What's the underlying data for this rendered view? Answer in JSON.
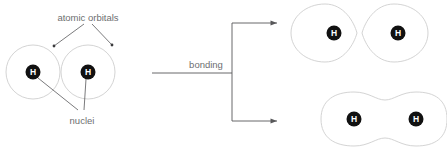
{
  "diagram": {
    "colors": {
      "background": "#ffffff",
      "orbital_stroke": "#d4d4d4",
      "nucleus_fill": "#111111",
      "nucleus_text": "#ffffff",
      "annotation_text": "#6d6e70",
      "leader_line": "#58585a"
    },
    "labels": {
      "atomic_orbitals": "atomic orbitals",
      "nuclei": "nuclei",
      "bonding": "bonding"
    },
    "left_group": {
      "name": "two separate hydrogen atomic orbitals",
      "atoms": [
        {
          "symbol": "H",
          "cx": 33,
          "cy": 72
        },
        {
          "symbol": "H",
          "cx": 88,
          "cy": 72
        }
      ],
      "orbitals": [
        {
          "cx": 33,
          "cy": 72,
          "r": 27
        },
        {
          "cx": 88,
          "cy": 72,
          "r": 27
        }
      ]
    },
    "arrow_group": {
      "name": "bonding transformation arrows",
      "arrow_count": 2,
      "arrows": [
        {
          "target": "antibonding-orbital"
        },
        {
          "target": "bonding-orbital"
        }
      ]
    },
    "right_top_group": {
      "name": "antibonding molecular orbital",
      "atoms": [
        {
          "symbol": "H",
          "cx": 334,
          "cy": 33
        },
        {
          "symbol": "H",
          "cx": 398,
          "cy": 33
        }
      ]
    },
    "right_bottom_group": {
      "name": "bonding molecular orbital",
      "atoms": [
        {
          "symbol": "H",
          "cx": 354,
          "cy": 119
        },
        {
          "symbol": "H",
          "cx": 416,
          "cy": 119
        }
      ]
    }
  }
}
